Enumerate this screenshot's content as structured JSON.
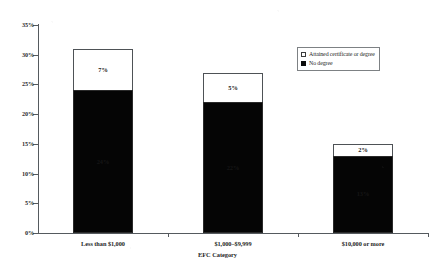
{
  "chart_data": {
    "type": "bar",
    "subtype": "stacked",
    "title": "",
    "xlabel": "EFC Category",
    "ylabel": "",
    "categories": [
      "Less than $1,000",
      "$1,000–$9,999",
      "$10,000 or more"
    ],
    "series": [
      {
        "name": "No degree",
        "values": [
          24,
          22,
          13
        ],
        "labels": [
          "24%",
          "22%",
          "13%"
        ],
        "color": "#050505"
      },
      {
        "name": "Attained certificate or degree",
        "values": [
          7,
          5,
          2
        ],
        "labels": [
          "7%",
          "5%",
          "2%"
        ],
        "color": "#ffffff"
      }
    ],
    "totals": [
      31,
      27,
      15
    ],
    "ylim": [
      0,
      35
    ],
    "yticks": [
      0,
      5,
      10,
      15,
      20,
      25,
      30,
      35
    ],
    "ytick_labels": [
      "0%",
      "5%",
      "10%",
      "15%",
      "20%",
      "25%",
      "30%",
      "35%"
    ],
    "grid": false,
    "legend_position": "upper-right"
  },
  "legend": {
    "items": [
      {
        "label": "Attained certificate or degree",
        "swatch": "open-square"
      },
      {
        "label": "No degree",
        "swatch": "filled-square"
      }
    ]
  },
  "axis": {
    "x_title": "EFC Category"
  }
}
